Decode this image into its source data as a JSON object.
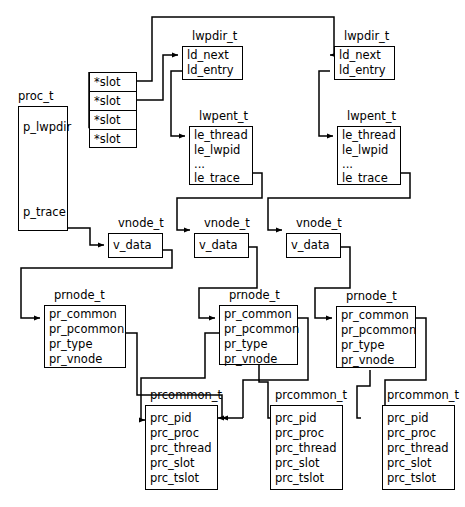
{
  "diagram": {
    "line_color": "#000000",
    "background": "#ffffff",
    "text_color": "#000000"
  },
  "structs": {
    "proc": {
      "caption": "proc_t",
      "fields": [
        "p_lwpdir",
        "p_trace"
      ]
    },
    "slot_array": {
      "cells": [
        "*slot",
        "*slot",
        "*slot",
        "*slot"
      ]
    },
    "lwpdir": {
      "caption": "lwpdir_t",
      "fields": [
        "ld_next",
        "ld_entry"
      ]
    },
    "lwpent": {
      "caption": "lwpent_t",
      "fields": [
        "le_thread",
        "le_lwpid",
        "...",
        "le_trace"
      ]
    },
    "vnode": {
      "caption": "vnode_t",
      "fields": [
        "v_data"
      ]
    },
    "prnode": {
      "caption": "prnode_t",
      "fields": [
        "pr_common",
        "pr_pcommon",
        "pr_type",
        "pr_vnode"
      ]
    },
    "prcommon": {
      "caption": "prcommon_t",
      "fields": [
        "prc_pid",
        "prc_proc",
        "prc_thread",
        "prc_slot",
        "prc_tslot"
      ]
    }
  }
}
